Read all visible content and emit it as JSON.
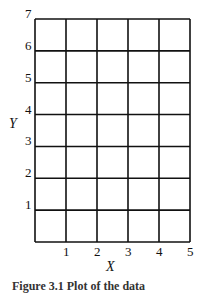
{
  "chart_data": {
    "type": "line",
    "title": "",
    "xlabel": "X",
    "ylabel": "Y",
    "xlim": [
      0,
      5
    ],
    "ylim": [
      0,
      7
    ],
    "x_ticks": [
      "1",
      "2",
      "3",
      "4",
      "5"
    ],
    "y_ticks": [
      "1",
      "2",
      "3",
      "4",
      "5",
      "6",
      "7"
    ],
    "grid": true,
    "series": [],
    "caption": "Figure 3.1  Plot of the data"
  }
}
